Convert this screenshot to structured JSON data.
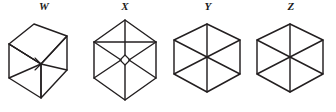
{
  "page": {
    "background_color": "#ffffff",
    "stroke_color": "#231f20",
    "width": 336,
    "height": 112
  },
  "figures": [
    {
      "label": "W",
      "name": "figure-w",
      "description": "Oblique box: front rhombus face with receding edges to upper right, internal diagonals",
      "x": 4,
      "width": 80
    },
    {
      "label": "X",
      "name": "figure-x",
      "description": "Hexagon with vertical long axis and three internal spokes meeting a small central diamond",
      "x": 86,
      "width": 78
    },
    {
      "label": "Y",
      "name": "figure-y",
      "description": "Hexagonal cube outline with top rhombus face and a vertical centre edge",
      "x": 168,
      "width": 80
    },
    {
      "label": "Z",
      "name": "figure-z",
      "description": "Hexagon with three full diagonals meeting at the centre point",
      "x": 250,
      "width": 82
    }
  ]
}
